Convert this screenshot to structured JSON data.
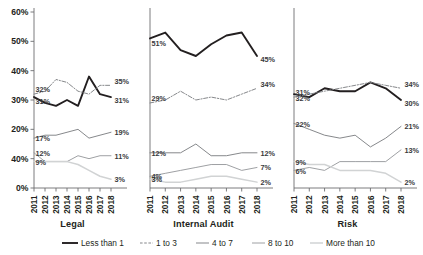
{
  "chart_data": {
    "type": "line",
    "title": "",
    "subtitle": "",
    "xlabel": "",
    "ylabel": "",
    "x": [
      "2011",
      "2012",
      "2013",
      "2014",
      "2015",
      "2016",
      "2017",
      "2018"
    ],
    "ylim": [
      0,
      60
    ],
    "yticks": [
      0,
      10,
      20,
      30,
      40,
      50,
      60
    ],
    "ytick_labels": [
      "0%",
      "40%",
      "20%",
      "30%",
      "40%",
      "50%",
      "60%"
    ],
    "grid": false,
    "legend_position": "bottom",
    "panels": [
      {
        "title": "Legal",
        "series": [
          {
            "name": "Less than 1",
            "style": "solid-thick",
            "color": "#231f20",
            "values": [
              31,
              29,
              28,
              30,
              28,
              38,
              32,
              31
            ],
            "label_start": "31%",
            "label_end": "31%"
          },
          {
            "name": "1 to 3",
            "style": "dash-dot",
            "color": "#808285",
            "values": [
              32,
              33,
              37,
              36,
              33,
              32,
              35,
              35
            ],
            "label_start": "32%",
            "label_end": "35%"
          },
          {
            "name": "4 to 7",
            "style": "solid-medium",
            "color": "#808285",
            "values": [
              17,
              18,
              18,
              19,
              20,
              17,
              18,
              19
            ],
            "label_start": "17%",
            "label_end": "19%"
          },
          {
            "name": "8 to 10",
            "style": "solid-thin",
            "color": "#939598",
            "values": [
              12,
              9,
              9,
              9,
              11,
              10,
              11,
              11
            ],
            "label_start": "12%",
            "label_end": "11%"
          },
          {
            "name": "More than 10",
            "style": "solid-light",
            "color": "#d1d3d4",
            "values": [
              9,
              9,
              9,
              9,
              8,
              6,
              4,
              3
            ],
            "label_start": "9%",
            "label_end": "3%"
          }
        ]
      },
      {
        "title": "Internal Audit",
        "series": [
          {
            "name": "Less than 1",
            "style": "solid-thick",
            "color": "#231f20",
            "values": [
              51,
              53,
              47,
              45,
              49,
              52,
              53,
              45
            ],
            "label_start": "51%",
            "label_end": "45%"
          },
          {
            "name": "1 to 3",
            "style": "dash-dot",
            "color": "#808285",
            "values": [
              29,
              30,
              33,
              30,
              31,
              30,
              32,
              34
            ],
            "label_start": "29%",
            "label_end": "34%"
          },
          {
            "name": "4 to 7",
            "style": "solid-medium",
            "color": "#808285",
            "values": [
              12,
              12,
              12,
              15,
              11,
              11,
              12,
              12
            ],
            "label_start": "12%",
            "label_end": "12%"
          },
          {
            "name": "8 to 10",
            "style": "solid-thin",
            "color": "#939598",
            "values": [
              4,
              5,
              6,
              7,
              8,
              8,
              6,
              7
            ],
            "label_start": "4%",
            "label_end": "7%"
          },
          {
            "name": "More than 10",
            "style": "solid-light",
            "color": "#d1d3d4",
            "values": [
              3,
              2,
              2,
              3,
              4,
              4,
              3,
              2
            ],
            "label_start": "3%",
            "label_end": "2%"
          }
        ]
      },
      {
        "title": "Risk",
        "series": [
          {
            "name": "Less than 1",
            "style": "solid-thick",
            "color": "#231f20",
            "values": [
              32,
              31,
              34,
              33,
              33,
              36,
              34,
              30
            ],
            "label_start": "32%",
            "label_end": "30%"
          },
          {
            "name": "1 to 3",
            "style": "dash-dot",
            "color": "#808285",
            "values": [
              31,
              32,
              33,
              34,
              35,
              36,
              35,
              34
            ],
            "label_start": "31%",
            "label_end": "34%"
          },
          {
            "name": "4 to 7",
            "style": "solid-medium",
            "color": "#808285",
            "values": [
              22,
              20,
              18,
              17,
              18,
              14,
              17,
              21
            ],
            "label_start": "22%",
            "label_end": "21%"
          },
          {
            "name": "8 to 10",
            "style": "solid-thin",
            "color": "#939598",
            "values": [
              6,
              7,
              6,
              9,
              9,
              9,
              9,
              13
            ],
            "label_start": "6%",
            "label_end": "13%"
          },
          {
            "name": "More than 10",
            "style": "solid-light",
            "color": "#d1d3d4",
            "values": [
              9,
              8,
              8,
              6,
              6,
              6,
              5,
              2
            ],
            "label_start": "9%",
            "label_end": "2%"
          }
        ]
      }
    ],
    "legend": [
      {
        "label": "Less than 1",
        "style": "solid-thick",
        "color": "#231f20"
      },
      {
        "label": "1 to 3",
        "style": "dash-dot",
        "color": "#808285"
      },
      {
        "label": "4 to 7",
        "style": "solid-medium",
        "color": "#808285"
      },
      {
        "label": "8 to 10",
        "style": "solid-thin",
        "color": "#939598"
      },
      {
        "label": "More than 10",
        "style": "solid-light",
        "color": "#d1d3d4"
      }
    ]
  }
}
